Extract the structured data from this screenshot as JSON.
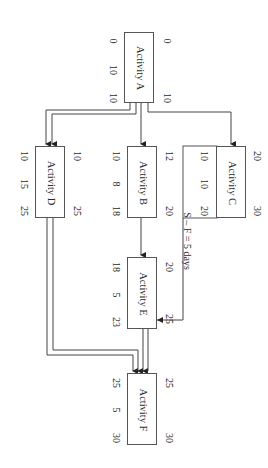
{
  "diagram": {
    "type": "precedence network (activity-on-node), rotated 90 degrees",
    "nodes": {
      "A": {
        "label": "Activity A",
        "es": "0",
        "ef": "10",
        "ls": "0",
        "duration": "10",
        "lf": "10"
      },
      "B": {
        "label": "Activity B",
        "es": "12",
        "ef": "20",
        "ls": "10",
        "duration": "8",
        "lf": "18"
      },
      "C": {
        "label": "Activity C",
        "es": "20",
        "ef": "30",
        "ls": "10",
        "duration": "10",
        "lf": "20"
      },
      "D": {
        "label": "Activity D",
        "es": "10",
        "ef": "25",
        "ls": "10",
        "duration": "15",
        "lf": "25"
      },
      "E": {
        "label": "Activity E",
        "es": "20",
        "ef": "25",
        "ls": "18",
        "duration": "5",
        "lf": "23"
      },
      "F": {
        "label": "Activity F",
        "es": "25",
        "ef": "30",
        "ls": "25",
        "duration": "5",
        "lf": "30"
      }
    },
    "links": [
      {
        "from": "A",
        "to": "D",
        "style": "double"
      },
      {
        "from": "A",
        "to": "B",
        "style": "single"
      },
      {
        "from": "A",
        "to": "C",
        "style": "single"
      },
      {
        "from": "B",
        "to": "E",
        "style": "single"
      },
      {
        "from": "C",
        "to": "E",
        "style": "single",
        "annotation": "S – F = 5 days"
      },
      {
        "from": "D",
        "to": "F",
        "style": "double"
      },
      {
        "from": "E",
        "to": "F",
        "style": "double"
      }
    ],
    "annotation": "S – F = 5 days"
  }
}
